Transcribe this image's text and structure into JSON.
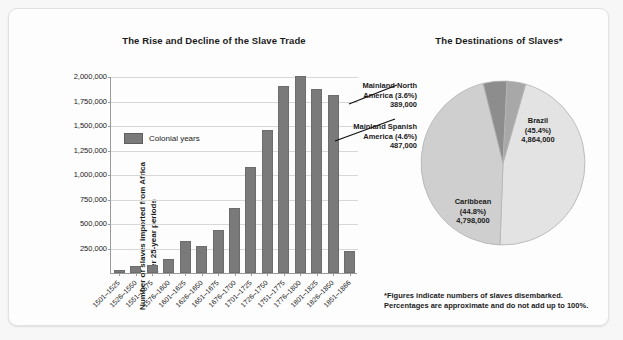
{
  "bar_panel": {
    "title": "The Rise and Decline of the Slave Trade",
    "ylabel_line1": "Number of slaves imported from Africa",
    "ylabel_line2": "per 25-year periods",
    "legend_label": "Colonial years"
  },
  "pie_panel": {
    "title": "The Destinations of Slaves*",
    "footnote_line1": "*Figures indicate numbers of slaves disembarked.",
    "footnote_line2": "Percentages are approximate and do not add up to 100%.",
    "callouts": [
      {
        "name": "Mainland North America",
        "label_line1": "Mainland North",
        "label_line2": "America (3.6%)",
        "label_line3": "389,000"
      },
      {
        "name": "Mainland Spanish America",
        "label_line1": "Mainland Spanish",
        "label_line2": "America (4.6%)",
        "label_line3": "487,000"
      }
    ],
    "inlabels": [
      {
        "name": "Brazil",
        "label_line1": "Brazil",
        "label_line2": "(45.4%)",
        "label_line3": "4,864,000"
      },
      {
        "name": "Caribbean",
        "label_line1": "Caribbean",
        "label_line2": "(44.8%)",
        "label_line3": "4,798,000"
      }
    ]
  },
  "colors": {
    "bar_fill": "#7a7a7a",
    "bar_stroke": "#6d6d6d",
    "grid": "#d8d8d8",
    "axis": "#9a9a9a",
    "pie_light": "#e3e3e3",
    "pie_mid": "#cfcfcf",
    "pie_dark": "#8d8d8d",
    "text": "#1b1b1b"
  },
  "chart_data": [
    {
      "type": "bar",
      "title": "The Rise and Decline of the Slave Trade",
      "xlabel": "",
      "ylabel": "Number of slaves imported from Africa per 25-year periods",
      "ylim": [
        0,
        2000000
      ],
      "yticks": [
        250000,
        500000,
        750000,
        1000000,
        1250000,
        1500000,
        1750000,
        2000000
      ],
      "ytick_labels": [
        "250,000",
        "500,000",
        "750,000",
        "1,000,000",
        "1,250,000",
        "1,500,000",
        "1,750,000",
        "2,000,000"
      ],
      "grid": true,
      "legend": [
        "Colonial years"
      ],
      "legend_position": "inside-upper-left",
      "categories": [
        "1501–1525",
        "1526–1550",
        "1551–1575",
        "1576–1600",
        "1601–1625",
        "1626–1650",
        "1651–1675",
        "1676–1700",
        "1701–1725",
        "1726–1750",
        "1751–1775",
        "1776–1800",
        "1801–1825",
        "1826–1850",
        "1851–1866"
      ],
      "values": [
        35000,
        75000,
        80000,
        140000,
        325000,
        275000,
        440000,
        665000,
        1085000,
        1460000,
        1910000,
        2015000,
        1880000,
        1820000,
        225000
      ]
    },
    {
      "type": "pie",
      "title": "The Destinations of Slaves*",
      "labels": [
        "Brazil",
        "Caribbean",
        "Mainland Spanish America",
        "Mainland North America"
      ],
      "percent": [
        45.4,
        44.8,
        4.6,
        3.6
      ],
      "values": [
        4864000,
        4798000,
        487000,
        389000
      ],
      "annotations": [
        "*Figures indicate numbers of slaves disembarked.",
        "Percentages are approximate and do not add up to 100%."
      ]
    }
  ]
}
